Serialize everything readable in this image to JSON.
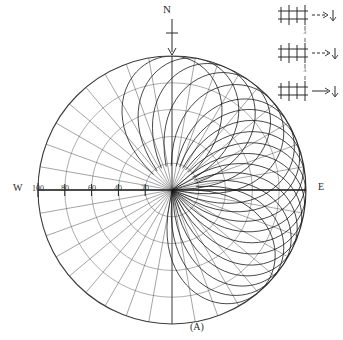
{
  "figure": {
    "caption": "(A)",
    "north_label": "N",
    "west_label": "W",
    "east_label": "E"
  },
  "chart_data": {
    "type": "line",
    "subtype": "polar-radiation-pattern",
    "title": "",
    "subtitle": "",
    "xlabel": "",
    "ylabel": "",
    "caption": "(A)",
    "grid": true,
    "legend_position": "top-right",
    "orientation": {
      "north": "N",
      "west": "W",
      "east": "E",
      "north_arrow": "down"
    },
    "radial_axis": {
      "label": "",
      "tick_labels": [
        "100",
        "80",
        "60",
        "40",
        "20"
      ],
      "tick_values": [
        100,
        80,
        60,
        40,
        20
      ],
      "rlim": [
        0,
        100
      ],
      "direction": "west",
      "units": ""
    },
    "angular_axis": {
      "spoke_count": 36,
      "spoke_step_deg": 10,
      "range_deg": [
        0,
        360
      ]
    },
    "arcs": {
      "count": 5,
      "radii": [
        20,
        40,
        60,
        80,
        100
      ]
    },
    "lobes": {
      "count": 16,
      "shape": "petal",
      "description": "overlapping petal lobes fanning from north through east",
      "peak_radius": 100,
      "peak_angles_deg": [
        90,
        78,
        66,
        54,
        42,
        30,
        22,
        14,
        6,
        -2,
        -10,
        -18,
        -26,
        -34,
        -42,
        -50
      ]
    },
    "series": [
      {
        "name": "pattern-lobes",
        "values": [
          100,
          100,
          100,
          100,
          100,
          100,
          100,
          100,
          100,
          100,
          100,
          100,
          100,
          100,
          100,
          100
        ]
      }
    ]
  },
  "legend": {
    "items": [
      {
        "symbol": "array-element-ladder",
        "arrow": "right",
        "label": ""
      },
      {
        "symbol": "array-element-ladder",
        "arrow": "right",
        "label": ""
      },
      {
        "symbol": "array-element-ladder",
        "arrow": "right",
        "label": ""
      }
    ],
    "separators": [
      {
        "text": "λ"
      },
      {
        "text": "λ"
      }
    ]
  }
}
